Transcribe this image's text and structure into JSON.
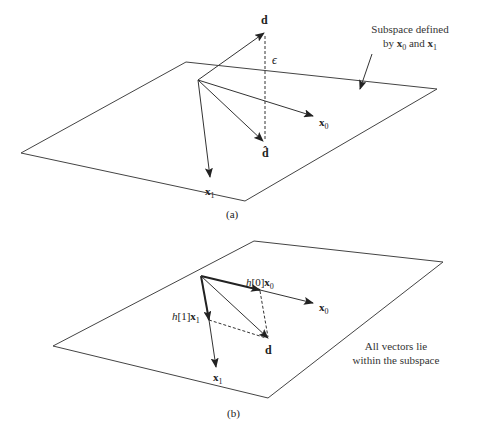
{
  "panel_a": {
    "caption": "(a)",
    "vectors": {
      "d": "d",
      "d_hat": "d̂",
      "epsilon": "ϵ",
      "x0": "x",
      "x0_sub": "0",
      "x1": "x",
      "x1_sub": "1"
    },
    "annotation": {
      "line1": "Subspace defined",
      "line2_prefix": "by ",
      "line2_x0": "x",
      "line2_x0_sub": "0",
      "line2_mid": " and ",
      "line2_x1": "x",
      "line2_x1_sub": "1"
    }
  },
  "panel_b": {
    "caption": "(b)",
    "vectors": {
      "h0_coef": "h",
      "h0_idx": "[0]",
      "h0_x": "x",
      "h0_sub": "0",
      "h1_coef": "h",
      "h1_idx": "[1]",
      "h1_x": "x",
      "h1_sub": "1",
      "x0": "x",
      "x0_sub": "0",
      "x1": "x",
      "x1_sub": "1",
      "d": "d"
    },
    "annotation": {
      "line1": "All vectors lie",
      "line2": "within the subspace"
    }
  },
  "colors": {
    "line": "#333333",
    "background": "#ffffff"
  }
}
